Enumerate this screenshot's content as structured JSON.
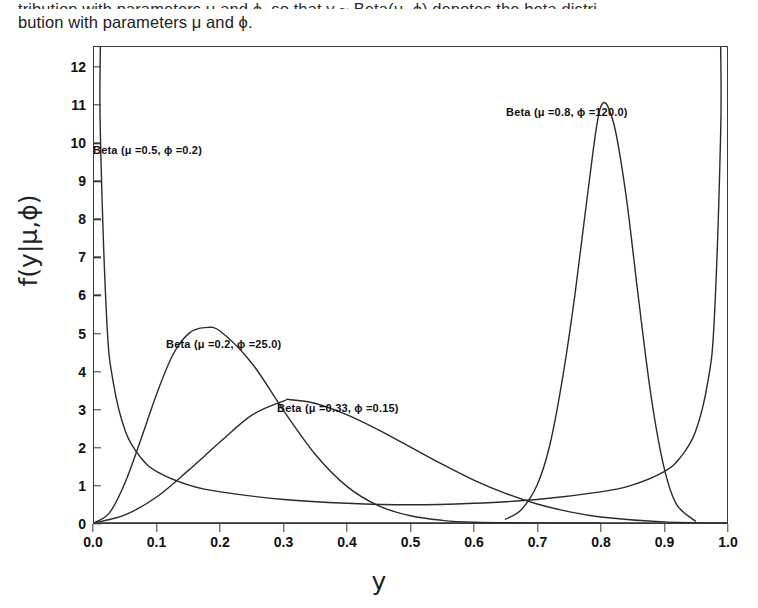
{
  "page_text": {
    "clipped_line": "tribution with parameters μ and ϕ, so that y ~ Beta(μ, ϕ) denotes the beta distri-",
    "body_line": "bution with parameters μ and ϕ."
  },
  "axes": {
    "x_title": "y",
    "y_title": "f(y|μ,ϕ)",
    "x_ticks": [
      "0.0",
      "0.1",
      "0.2",
      "0.3",
      "0.4",
      "0.5",
      "0.6",
      "0.7",
      "0.8",
      "0.9",
      "1.0"
    ],
    "x_tick_values": [
      0.0,
      0.1,
      0.2,
      0.3,
      0.4,
      0.5,
      0.6,
      0.7,
      0.8,
      0.9,
      1.0
    ],
    "y_ticks": [
      "0",
      "1",
      "2",
      "3",
      "4",
      "5",
      "6",
      "7",
      "8",
      "9",
      "10",
      "11",
      "12"
    ],
    "y_tick_values": [
      0,
      1,
      2,
      3,
      4,
      5,
      6,
      7,
      8,
      9,
      10,
      11,
      12
    ],
    "xlim": [
      0.0,
      1.0
    ],
    "ylim": [
      0,
      12.55
    ]
  },
  "annotations": [
    {
      "text": "Beta (μ =0.5, ϕ =0.2)",
      "left": 93,
      "top": 104
    },
    {
      "text": "Beta (μ =0.2, ϕ =25.0)",
      "left": 166,
      "top": 298
    },
    {
      "text": "Beta (μ =0.33, ϕ =0.15)",
      "left": 277,
      "top": 362
    },
    {
      "text": "Beta (μ =0.8, ϕ =120.0)",
      "left": 506,
      "top": 66
    }
  ],
  "style": {
    "line_color": "#2b2b2b",
    "frame_color": "#3a3a3a",
    "background": "#ffffff"
  },
  "chart_data": {
    "type": "line",
    "title": "",
    "xlabel": "y",
    "ylabel": "f(y|μ,ϕ)",
    "xlim": [
      0.0,
      1.0
    ],
    "ylim": [
      0,
      12.55
    ],
    "grid": false,
    "legend": "annotations-inline",
    "series": [
      {
        "name": "Beta (μ =0.5, ϕ =0.2)",
        "mu": 0.5,
        "phi": 0.2,
        "alpha": 0.1,
        "beta": 0.1,
        "shape": "u-shaped",
        "peak_value": 10.3,
        "min_value": 0.35,
        "x": [
          0.01,
          0.02,
          0.03,
          0.05,
          0.075,
          0.1,
          0.15,
          0.2,
          0.3,
          0.4,
          0.5,
          0.6,
          0.7,
          0.8,
          0.85,
          0.9,
          0.925,
          0.95,
          0.97,
          0.98,
          0.99
        ],
        "y": [
          10.3,
          5.4,
          3.75,
          2.4,
          1.7,
          1.35,
          1.0,
          0.82,
          0.62,
          0.52,
          0.48,
          0.52,
          0.62,
          0.82,
          1.0,
          1.35,
          1.7,
          2.4,
          3.75,
          5.4,
          10.3
        ]
      },
      {
        "name": "Beta (μ =0.2, ϕ =25.0)",
        "mu": 0.2,
        "phi": 25.0,
        "alpha": 5.0,
        "beta": 20.0,
        "shape": "unimodal",
        "mode": 0.175,
        "peak_value": 5.15,
        "x": [
          0.0,
          0.025,
          0.05,
          0.075,
          0.1,
          0.125,
          0.15,
          0.175,
          0.2,
          0.25,
          0.3,
          0.35,
          0.4,
          0.45,
          0.5,
          0.55,
          0.6,
          0.7,
          0.8
        ],
        "y": [
          0.0,
          0.28,
          1.1,
          2.25,
          3.45,
          4.45,
          5.0,
          5.15,
          5.05,
          4.2,
          2.95,
          1.8,
          0.96,
          0.45,
          0.19,
          0.07,
          0.02,
          0.0,
          0.0
        ]
      },
      {
        "name": "Beta (μ =0.33, ϕ =0.15)",
        "mu": 0.33,
        "phi": 0.15,
        "shape": "unimodal-broad",
        "mode": 0.31,
        "peak_value": 3.25,
        "x": [
          0.0,
          0.05,
          0.1,
          0.15,
          0.2,
          0.25,
          0.3,
          0.31,
          0.35,
          0.4,
          0.45,
          0.5,
          0.55,
          0.6,
          0.65,
          0.7,
          0.75,
          0.8,
          0.9,
          1.0
        ],
        "y": [
          0.0,
          0.22,
          0.7,
          1.4,
          2.15,
          2.85,
          3.22,
          3.25,
          3.15,
          2.85,
          2.45,
          2.0,
          1.55,
          1.13,
          0.78,
          0.5,
          0.3,
          0.16,
          0.03,
          0.0
        ]
      },
      {
        "name": "Beta (μ =0.8, ϕ =120.0)",
        "mu": 0.8,
        "phi": 120.0,
        "alpha": 96.0,
        "beta": 24.0,
        "shape": "unimodal-sharp",
        "mode": 0.8,
        "peak_value": 10.95,
        "x": [
          0.65,
          0.675,
          0.7,
          0.72,
          0.74,
          0.76,
          0.78,
          0.8,
          0.82,
          0.84,
          0.86,
          0.88,
          0.9,
          0.92,
          0.95
        ],
        "y": [
          0.1,
          0.35,
          1.0,
          2.05,
          3.8,
          6.05,
          8.7,
          10.95,
          10.6,
          8.7,
          5.95,
          3.35,
          1.5,
          0.5,
          0.05
        ]
      },
      {
        "name": "baseline",
        "shape": "flat",
        "value": 0.0,
        "x": [
          0.0,
          1.0
        ],
        "y": [
          0.0,
          0.0
        ]
      }
    ]
  }
}
